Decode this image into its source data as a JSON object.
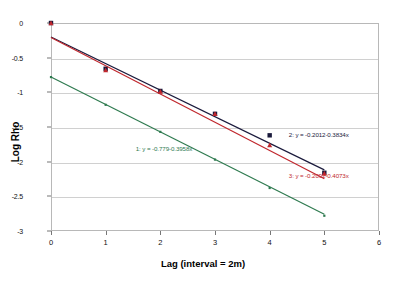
{
  "chart_data": {
    "type": "scatter",
    "title": "",
    "xlabel": "Lag (interval = 2m)",
    "ylabel": "Log Rho",
    "xlim": [
      0,
      6
    ],
    "ylim": [
      -3,
      0
    ],
    "xticks": [
      "0",
      "1",
      "2",
      "3",
      "4",
      "5",
      "6"
    ],
    "yticks": [
      "0",
      "-0.5",
      "-1",
      "-1.5",
      "-2",
      "-2.5",
      "-3"
    ],
    "grid": true,
    "legend": "none",
    "x": [
      0,
      1,
      2,
      3,
      4,
      5
    ],
    "series": [
      {
        "name": "1",
        "marker": "point",
        "color": "#2e7a4f",
        "values": [
          -0.78,
          -1.18,
          -1.57,
          -1.97,
          -2.38,
          -2.78
        ],
        "fit_equation": "1:   y = -0.779-0.3958x",
        "intercept": -0.779,
        "slope": -0.3958
      },
      {
        "name": "2",
        "marker": "square",
        "color": "#1a1a3c",
        "values": [
          0.0,
          -0.66,
          -0.98,
          -1.31,
          -1.62,
          -2.16
        ],
        "fit_equation": "2:   y = -0.2012-0.3834x",
        "intercept": -0.2012,
        "slope": -0.3834
      },
      {
        "name": "3",
        "marker": "triangle",
        "color": "#c0272d",
        "values": [
          0.0,
          -0.68,
          -0.99,
          -1.31,
          -1.76,
          -2.17
        ],
        "fit_equation": "3:   y = -0.2092-0.4073x",
        "intercept": -0.2092,
        "slope": -0.4073
      }
    ],
    "annotations": [
      {
        "text": "1:   y = -0.779-0.3958x",
        "color": "#2e7a4f",
        "x": 1.55,
        "y": -1.82
      },
      {
        "text": "2:   y = -0.2012-0.3834x",
        "color": "#1a1a3c",
        "x": 4.35,
        "y": -1.62
      },
      {
        "text": "3:   y = -0.2092-0.4073x",
        "color": "#c0272d",
        "x": 4.35,
        "y": -2.21
      }
    ]
  }
}
